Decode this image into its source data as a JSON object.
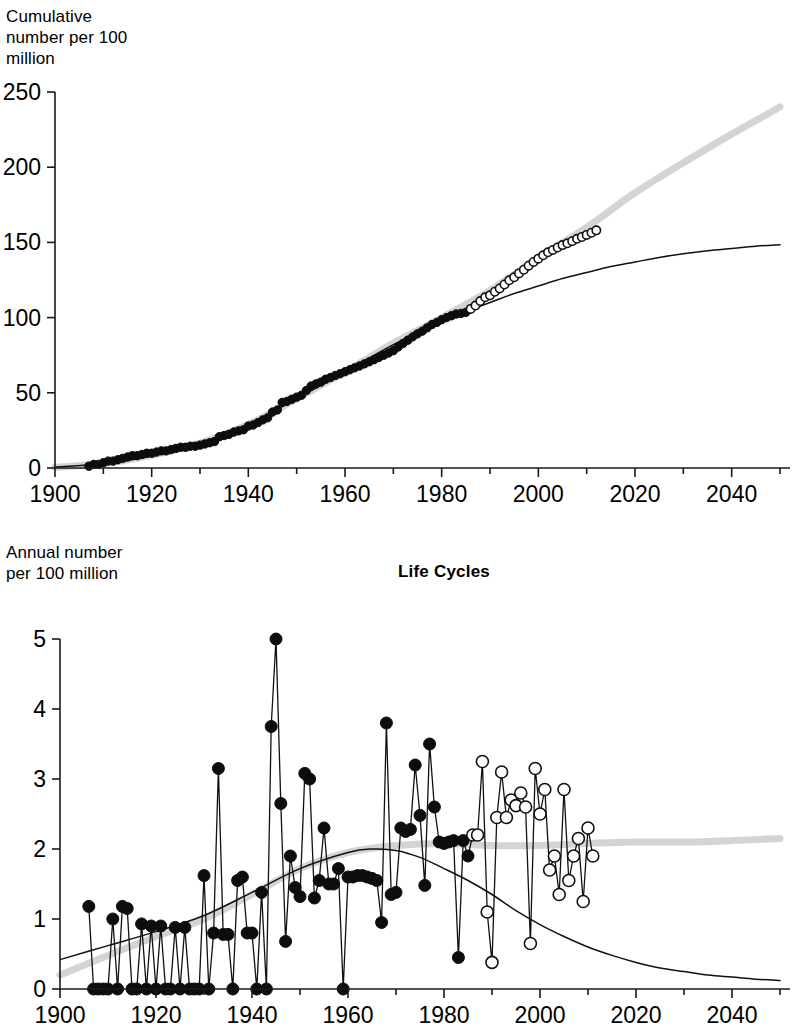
{
  "figure": {
    "background_color": "#ffffff",
    "foreground_color": "#000000",
    "band_color": "#d4d4d4"
  },
  "top_panel": {
    "ylabel": "Cumulative\nnumber per 100\nmillion",
    "ylabel_line1": "Cumulative",
    "ylabel_line2": "number per 100",
    "ylabel_line3": "million"
  },
  "bottom_panel": {
    "title": "Life Cycles",
    "ylabel_line1": "Annual number",
    "ylabel_line2": "per 100 million"
  },
  "chart_data": [
    {
      "type": "line",
      "id": "cumulative-panel",
      "title": "",
      "xlabel": "",
      "ylabel": "Cumulative number per 100 million",
      "xlim": [
        1900,
        2050
      ],
      "ylim": [
        0,
        250
      ],
      "xticks": [
        1900,
        1920,
        1940,
        1960,
        1980,
        2000,
        2020,
        2040
      ],
      "yticks": [
        0,
        50,
        100,
        150,
        200,
        250
      ],
      "grid": false,
      "legend": "none",
      "series": [
        {
          "name": "Observed cumulative (filled circles)",
          "marker": "filled-circle",
          "x": [
            1907,
            1908,
            1909,
            1910,
            1911,
            1912,
            1913,
            1914,
            1915,
            1916,
            1917,
            1918,
            1919,
            1920,
            1921,
            1922,
            1923,
            1924,
            1925,
            1926,
            1927,
            1928,
            1929,
            1930,
            1931,
            1932,
            1933,
            1934,
            1935,
            1936,
            1937,
            1938,
            1939,
            1940,
            1941,
            1942,
            1943,
            1944,
            1945,
            1946,
            1947,
            1948,
            1949,
            1950,
            1951,
            1952,
            1953,
            1954,
            1955,
            1956,
            1957,
            1958,
            1959,
            1960,
            1961,
            1962,
            1963,
            1964,
            1965,
            1966,
            1967,
            1968,
            1969,
            1970,
            1971,
            1972,
            1973,
            1974,
            1975,
            1976,
            1977,
            1978,
            1979,
            1980,
            1981,
            1982,
            1983,
            1984,
            1985
          ],
          "values": [
            1.2,
            2.4,
            2.4,
            3.5,
            4.6,
            4.6,
            5.5,
            6.4,
            7.3,
            8.2,
            8.2,
            9.0,
            9.8,
            9.8,
            10.6,
            11.4,
            11.4,
            12.2,
            13.0,
            13.8,
            13.8,
            14.5,
            14.5,
            15.2,
            16.0,
            16.8,
            17.6,
            20.8,
            21.6,
            22.4,
            23.9,
            24.7,
            25.4,
            27.9,
            28.6,
            30.2,
            32.0,
            33.4,
            37.2,
            38.6,
            43.6,
            44.3,
            45.7,
            47.1,
            48.4,
            51.5,
            54.5,
            55.9,
            57.1,
            59.0,
            60.2,
            61.5,
            62.7,
            64.0,
            65.3,
            66.6,
            67.8,
            69.2,
            70.6,
            72.0,
            73.5,
            75.0,
            76.5,
            78.0,
            80.5,
            82.8,
            85.0,
            87.2,
            89.2,
            91.0,
            93.2,
            95.4,
            96.8,
            98.6,
            100.0,
            101.2,
            102.4,
            102.8,
            103.5
          ]
        },
        {
          "name": "Recent cumulative (open circles)",
          "marker": "open-circle",
          "x": [
            1986,
            1987,
            1988,
            1989,
            1990,
            1991,
            1992,
            1993,
            1994,
            1995,
            1996,
            1997,
            1998,
            1999,
            2000,
            2001,
            2002,
            2003,
            2004,
            2005,
            2006,
            2007,
            2008,
            2009,
            2010,
            2011,
            2012
          ],
          "values": [
            105.8,
            108.0,
            111.0,
            113.5,
            114.8,
            117.2,
            119.4,
            122.0,
            124.8,
            126.8,
            129.4,
            131.8,
            134.5,
            137.0,
            139.2,
            141.4,
            143.4,
            145.0,
            146.6,
            148.2,
            149.4,
            150.8,
            152.4,
            153.6,
            155.0,
            156.4,
            158.0
          ]
        },
        {
          "name": "Logistic fit (thin black curve)",
          "marker": "none",
          "x": [
            1900,
            1910,
            1920,
            1930,
            1940,
            1950,
            1960,
            1970,
            1980,
            1985,
            1990,
            1995,
            2000,
            2005,
            2010,
            2015,
            2020,
            2025,
            2030,
            2035,
            2040,
            2045,
            2050
          ],
          "values": [
            0.6,
            3.0,
            8.0,
            16.0,
            29.0,
            46.0,
            64.0,
            82.0,
            98.0,
            104.0,
            110.0,
            116.0,
            121.0,
            126.0,
            130.0,
            134.0,
            137.0,
            140.0,
            142.5,
            144.5,
            146.0,
            147.5,
            148.5
          ]
        },
        {
          "name": "Alternative projection (thick gray band)",
          "marker": "none",
          "x": [
            1900,
            1910,
            1920,
            1930,
            1940,
            1950,
            1960,
            1970,
            1980,
            1990,
            2000,
            2010,
            2020,
            2030,
            2040,
            2050
          ],
          "values": [
            0.5,
            3.0,
            8.5,
            16.5,
            29.0,
            46.0,
            64.0,
            83.0,
            100.0,
            118.0,
            140.0,
            160.0,
            183.0,
            203.0,
            222.0,
            240.0
          ]
        }
      ]
    },
    {
      "type": "line",
      "id": "annual-panel",
      "title": "Life Cycles",
      "xlabel": "",
      "ylabel": "Annual number per 100 million",
      "xlim": [
        1900,
        2050
      ],
      "ylim": [
        0,
        5
      ],
      "xticks": [
        1900,
        1920,
        1940,
        1960,
        1980,
        2000,
        2020,
        2040
      ],
      "yticks": [
        0,
        1,
        2,
        3,
        4,
        5
      ],
      "grid": false,
      "legend": "none",
      "series": [
        {
          "name": "Observed annual (filled circles)",
          "marker": "filled-circle",
          "x": [
            1906,
            1907,
            1908,
            1909,
            1910,
            1911,
            1912,
            1913,
            1914,
            1915,
            1916,
            1917,
            1918,
            1919,
            1920,
            1921,
            1922,
            1923,
            1924,
            1925,
            1926,
            1927,
            1928,
            1929,
            1930,
            1931,
            1932,
            1933,
            1934,
            1935,
            1936,
            1937,
            1938,
            1939,
            1940,
            1941,
            1942,
            1943,
            1944,
            1945,
            1946,
            1947,
            1948,
            1949,
            1950,
            1951,
            1952,
            1953,
            1954,
            1955,
            1956,
            1957,
            1958,
            1959,
            1960,
            1961,
            1962,
            1963,
            1964,
            1965,
            1966,
            1967,
            1968,
            1969,
            1970,
            1971,
            1972,
            1973,
            1974,
            1975,
            1976,
            1977,
            1978,
            1979,
            1980,
            1981,
            1982,
            1983,
            1984,
            1985
          ],
          "values": [
            1.18,
            0.0,
            0.0,
            0.0,
            0.0,
            1.0,
            0.0,
            1.18,
            1.15,
            0.0,
            0.0,
            0.93,
            0.0,
            0.9,
            0.0,
            0.9,
            0.0,
            0.0,
            0.88,
            0.0,
            0.88,
            0.0,
            0.0,
            0.0,
            1.62,
            0.0,
            0.8,
            3.15,
            0.78,
            0.78,
            0.0,
            1.55,
            1.6,
            0.8,
            0.8,
            0.0,
            1.38,
            0.0,
            3.75,
            5.0,
            2.65,
            0.68,
            1.9,
            1.45,
            1.32,
            3.08,
            3.0,
            1.3,
            1.55,
            2.3,
            1.5,
            1.5,
            1.72,
            0.0,
            1.6,
            1.6,
            1.62,
            1.62,
            1.6,
            1.58,
            1.55,
            0.95,
            3.8,
            1.35,
            1.38,
            2.3,
            2.25,
            2.28,
            3.2,
            2.48,
            1.48,
            3.5,
            2.6,
            2.1,
            2.08,
            2.1,
            2.12,
            0.45,
            2.12,
            1.9
          ]
        },
        {
          "name": "Recent annual (open circles)",
          "marker": "open-circle",
          "x": [
            1986,
            1987,
            1988,
            1989,
            1990,
            1991,
            1992,
            1993,
            1994,
            1995,
            1996,
            1997,
            1998,
            1999,
            2000,
            2001,
            2002,
            2003,
            2004,
            2005,
            2006,
            2007,
            2008,
            2009,
            2010,
            2011
          ],
          "values": [
            2.2,
            2.2,
            3.25,
            1.1,
            0.38,
            2.45,
            3.1,
            2.45,
            2.7,
            2.62,
            2.8,
            2.6,
            0.65,
            3.15,
            2.5,
            2.85,
            1.7,
            1.9,
            1.35,
            2.85,
            1.55,
            1.9,
            2.15,
            1.25,
            2.3,
            1.9
          ]
        },
        {
          "name": "Logistic derivative fit (thin black curve)",
          "marker": "none",
          "x": [
            1900,
            1910,
            1920,
            1930,
            1940,
            1950,
            1960,
            1965,
            1970,
            1975,
            1980,
            1985,
            1990,
            1995,
            2000,
            2005,
            2010,
            2015,
            2020,
            2025,
            2030,
            2035,
            2040,
            2045,
            2050
          ],
          "values": [
            0.42,
            0.62,
            0.82,
            1.05,
            1.38,
            1.72,
            1.95,
            2.0,
            1.98,
            1.88,
            1.72,
            1.55,
            1.35,
            1.12,
            0.92,
            0.75,
            0.6,
            0.48,
            0.38,
            0.3,
            0.25,
            0.2,
            0.17,
            0.14,
            0.12
          ]
        },
        {
          "name": "Alternative projection (thick gray band)",
          "marker": "none",
          "x": [
            1900,
            1910,
            1920,
            1930,
            1940,
            1950,
            1960,
            1970,
            1980,
            1990,
            2000,
            2010,
            2020,
            2030,
            2040,
            2050
          ],
          "values": [
            0.2,
            0.48,
            0.75,
            1.0,
            1.35,
            1.72,
            1.95,
            2.05,
            2.08,
            2.05,
            2.05,
            2.08,
            2.1,
            2.1,
            2.12,
            2.15
          ]
        }
      ]
    }
  ]
}
